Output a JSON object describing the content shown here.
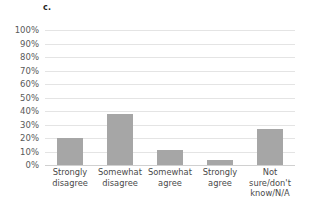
{
  "chart_data": {
    "type": "bar",
    "title": "c.",
    "xlabel": "",
    "ylabel": "",
    "categories": [
      "Strongly disagree",
      "Somewhat disagree",
      "Somewhat agree",
      "Strongly agree",
      "Not sure/don't know/N/A"
    ],
    "values": [
      20,
      38,
      11,
      4,
      27
    ],
    "value_labels": [
      "20%",
      "38%",
      "11%",
      "4%",
      "27%"
    ],
    "ylim": [
      0,
      100
    ],
    "y_ticks": [
      0,
      10,
      20,
      30,
      40,
      50,
      60,
      70,
      80,
      90,
      100
    ],
    "y_tick_labels": [
      "0%",
      "10%",
      "20%",
      "30%",
      "40%",
      "50%",
      "60%",
      "70%",
      "80%",
      "90%",
      "100%"
    ],
    "grid": "horizontal",
    "legend": "none",
    "bar_color": "#a6a6a6",
    "gridline_color": "#e4e4e4",
    "axis_color": "#d0d0d0",
    "background_color": "#ffffff"
  },
  "axis": {
    "y_ticks": [
      {
        "label": "100%",
        "value": 100
      },
      {
        "label": "90%",
        "value": 90
      },
      {
        "label": "80%",
        "value": 80
      },
      {
        "label": "70%",
        "value": 70
      },
      {
        "label": "60%",
        "value": 60
      },
      {
        "label": "50%",
        "value": 50
      },
      {
        "label": "40%",
        "value": 40
      },
      {
        "label": "30%",
        "value": 30
      },
      {
        "label": "20%",
        "value": 20
      },
      {
        "label": "10%",
        "value": 10
      },
      {
        "label": "0%",
        "value": 0
      }
    ]
  },
  "categories": [
    {
      "line1": "Strongly",
      "line2": "disagree"
    },
    {
      "line1": "Somewhat",
      "line2": "disagree"
    },
    {
      "line1": "Somewhat",
      "line2": "agree"
    },
    {
      "line1": "Strongly",
      "line2": "agree"
    },
    {
      "line1": "Not sure/don't",
      "line2": "know/N/A"
    }
  ]
}
